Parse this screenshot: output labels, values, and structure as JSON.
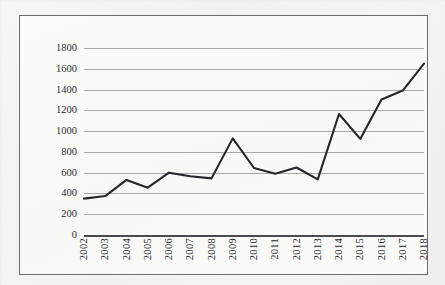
{
  "chart_data": {
    "type": "line",
    "title": "",
    "subtitle": "",
    "xlabel": "",
    "ylabel": "",
    "categories": [
      "2002",
      "2003",
      "2004",
      "2005",
      "2006",
      "2007",
      "2008",
      "2009",
      "2010",
      "2011",
      "2012",
      "2013",
      "2014",
      "2015",
      "2016",
      "2017",
      "2018"
    ],
    "values": [
      350,
      375,
      530,
      455,
      600,
      565,
      545,
      930,
      645,
      590,
      650,
      535,
      1165,
      925,
      1305,
      1390,
      1650
    ],
    "series": [
      {
        "name": "",
        "values": [
          350,
          375,
          530,
          455,
          600,
          565,
          545,
          930,
          645,
          590,
          650,
          535,
          1165,
          925,
          1305,
          1390,
          1650
        ]
      }
    ],
    "ylim": [
      0,
      1800
    ],
    "yticks": [
      0,
      200,
      400,
      600,
      800,
      1000,
      1200,
      1400,
      1600,
      1800
    ],
    "ytick_labels": [
      "0",
      "200",
      "400",
      "600",
      "800",
      "1000",
      "1200",
      "1400",
      "1600",
      "1800"
    ],
    "xtick_labels": [
      "2002",
      "2003",
      "2004",
      "2005",
      "2006",
      "2007",
      "2008",
      "2009",
      "2010",
      "2011",
      "2012",
      "2013",
      "2014",
      "2015",
      "2016",
      "2017",
      "2018"
    ],
    "grid": true,
    "legend": false,
    "legend_position": "none",
    "annotations": [],
    "colors": {
      "line": "#26262b",
      "gridline": "#9a9a9e",
      "axis": "#4a4a50",
      "border": "#6b6b70",
      "plot_background": "#fbfbfa",
      "page_background": "#f2f2f0",
      "tick_text": "#2b2b30"
    }
  }
}
